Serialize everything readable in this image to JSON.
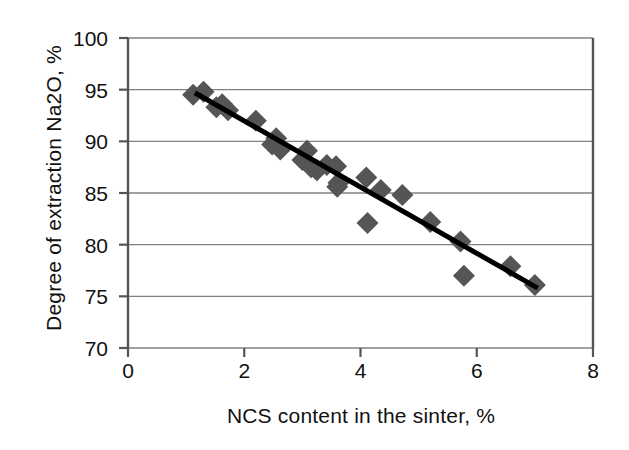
{
  "chart_data": {
    "type": "scatter",
    "title": "",
    "xlabel": "NCS content in the sinter, %",
    "ylabel": "Degree of extraction Na2O, %",
    "xlim": [
      0,
      8
    ],
    "ylim": [
      70,
      100
    ],
    "xticks": [
      0,
      2,
      4,
      6,
      8
    ],
    "yticks": [
      70,
      75,
      80,
      85,
      90,
      95,
      100
    ],
    "grid": "horizontal",
    "legend": "none",
    "marker": "diamond",
    "marker_color": "#555555",
    "marker_size": 11,
    "trendline": {
      "type": "line",
      "color": "#000000",
      "width": 5,
      "x": [
        1.15,
        7.05
      ],
      "y": [
        94.7,
        75.8
      ],
      "slope": -3.2,
      "intercept": 98.4
    },
    "series": [
      {
        "name": "Degree of extraction Na2O",
        "points": [
          {
            "x": 1.12,
            "y": 94.5
          },
          {
            "x": 1.3,
            "y": 94.8
          },
          {
            "x": 1.52,
            "y": 93.3
          },
          {
            "x": 1.62,
            "y": 93.6
          },
          {
            "x": 1.72,
            "y": 93.0
          },
          {
            "x": 2.2,
            "y": 92.0
          },
          {
            "x": 2.48,
            "y": 89.7
          },
          {
            "x": 2.55,
            "y": 90.3
          },
          {
            "x": 2.62,
            "y": 89.2
          },
          {
            "x": 3.0,
            "y": 88.2
          },
          {
            "x": 3.08,
            "y": 89.1
          },
          {
            "x": 3.15,
            "y": 87.5
          },
          {
            "x": 3.25,
            "y": 87.2
          },
          {
            "x": 3.42,
            "y": 87.7
          },
          {
            "x": 3.58,
            "y": 87.6
          },
          {
            "x": 3.6,
            "y": 85.6
          },
          {
            "x": 3.62,
            "y": 86.0
          },
          {
            "x": 4.1,
            "y": 86.5
          },
          {
            "x": 4.12,
            "y": 82.1
          },
          {
            "x": 4.35,
            "y": 85.3
          },
          {
            "x": 4.72,
            "y": 84.8
          },
          {
            "x": 5.2,
            "y": 82.2
          },
          {
            "x": 5.72,
            "y": 80.3
          },
          {
            "x": 5.78,
            "y": 77.0
          },
          {
            "x": 6.58,
            "y": 77.9
          },
          {
            "x": 7.0,
            "y": 76.1
          }
        ]
      }
    ]
  },
  "axes": {
    "y_title": "Degree of extraction Na2O, %",
    "x_title": "NCS content in the sinter, %",
    "y_tick_labels": [
      "100",
      "95",
      "90",
      "85",
      "80",
      "75",
      "70"
    ],
    "x_tick_labels": [
      "0",
      "2",
      "4",
      "6",
      "8"
    ]
  }
}
